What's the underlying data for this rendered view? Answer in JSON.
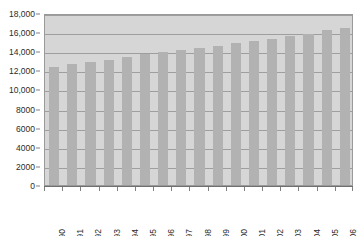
{
  "chart_data": {
    "type": "bar",
    "title": "",
    "subtitle": "",
    "xlabel": "",
    "ylabel": "",
    "categories": [
      "1990",
      "1991",
      "1992",
      "1993",
      "1994",
      "1995",
      "1996",
      "1997",
      "1998",
      "1999",
      "2000",
      "2001",
      "2002",
      "2003",
      "2004",
      "2005",
      "2006"
    ],
    "values": [
      12400,
      12650,
      12850,
      13050,
      13350,
      13700,
      13950,
      14100,
      14350,
      14600,
      14900,
      15100,
      15300,
      15550,
      15800,
      16200,
      16400
    ],
    "series": [
      {
        "name": "",
        "values": [
          12400,
          12650,
          12850,
          13050,
          13350,
          13700,
          13950,
          14100,
          14350,
          14600,
          14900,
          15100,
          15300,
          15550,
          15800,
          16200,
          16400
        ]
      }
    ],
    "ylim": [
      0,
      18000
    ],
    "ytick_values": [
      0,
      2000,
      4000,
      6000,
      8000,
      10000,
      12000,
      14000,
      16000,
      18000
    ],
    "ytick_labels": [
      "0",
      "2000",
      "4000",
      "6000",
      "8000",
      "10,000",
      "12,000",
      "14,000",
      "16,000",
      "18,000"
    ],
    "grid": true,
    "grid_axis": "y",
    "legend": false,
    "legend_position": "none",
    "annotations": [],
    "xtick_rotation": -90
  },
  "style": {
    "bar_color": "#b2b2b2",
    "plot_background": "#d6d6d6",
    "page_background": "#ffffff",
    "grid_color": "#9e9e9e",
    "frame_color": "#9a9a9a",
    "axis_color": "#6f6f6f",
    "text_color": "#2b2b2b"
  }
}
